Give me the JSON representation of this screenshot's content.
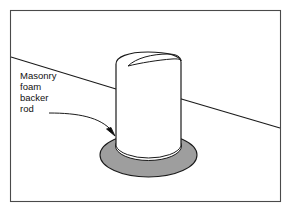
{
  "figure": {
    "background_color": "#ffffff",
    "frame_color": "#4a4a4a",
    "line_color": "#1a1a1a"
  },
  "annotation": {
    "label_lines": [
      "Masonry",
      "foam",
      "backer",
      "rod"
    ],
    "leader_style": "curved-line-with-arrowhead",
    "arrow_target": "backer-rod-ring"
  },
  "parts": {
    "pipe": {
      "name": "cylindrical pipe",
      "fill_color": "#ffffff",
      "outline_color": "#1a1a1a"
    },
    "backer_rod": {
      "name": "foam backer rod ring",
      "fill_color": "#9e9e9e",
      "outline_color": "#1a1a1a"
    },
    "grade_line": {
      "name": "masonry surface line",
      "color": "#1a1a1a"
    }
  }
}
